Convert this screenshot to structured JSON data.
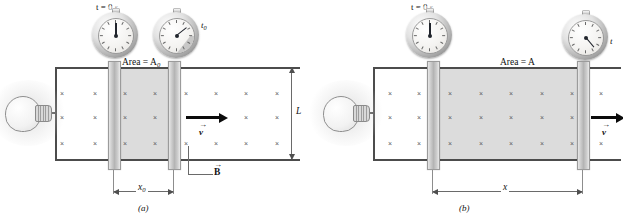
{
  "figure": {
    "type": "physics-diagram",
    "panels": [
      {
        "id": "a",
        "caption": "(a)",
        "area_label": "Area = A",
        "area_subscript": "0",
        "length_label": "L",
        "distance_label": "x",
        "distance_subscript": "0",
        "velocity_label": "v",
        "field_label": "B",
        "watches": [
          {
            "label": "t = 0 s",
            "label_sub": "",
            "hand_angle_deg": 0,
            "wedge": false
          },
          {
            "label": "t",
            "label_sub": "0",
            "hand_angle_deg": 52,
            "wedge": true,
            "wedge_sweep_deg": 52
          }
        ],
        "bar_positions": {
          "left_bar_x": 0.0,
          "right_bar_x": 1.0
        },
        "field_marks": {
          "symbol": "×",
          "rows": 3,
          "cols": 8
        }
      },
      {
        "id": "b",
        "caption": "(b)",
        "area_label": "Area = A",
        "area_subscript": "",
        "length_label": "",
        "distance_label": "x",
        "distance_subscript": "",
        "velocity_label": "v",
        "field_label": "",
        "watches": [
          {
            "label": "t = 0 s",
            "label_sub": "",
            "hand_angle_deg": 0,
            "wedge": false
          },
          {
            "label": "t",
            "label_sub": "",
            "hand_angle_deg": 140,
            "wedge": false
          }
        ],
        "bar_positions": {
          "left_bar_x": 0.0,
          "right_bar_x": 1.0
        },
        "field_marks": {
          "symbol": "×",
          "rows": 3,
          "cols": 8
        }
      }
    ],
    "colors": {
      "ink": "#111111",
      "rail": "#4c4c4c",
      "flux_fill": "#d6d6d6",
      "bar_fill": "#b4b4b4",
      "field_mark": "#5c5c5c",
      "arrow": "#0b0b0b",
      "dimension": "#6a6a6a",
      "background": "#ffffff"
    }
  }
}
